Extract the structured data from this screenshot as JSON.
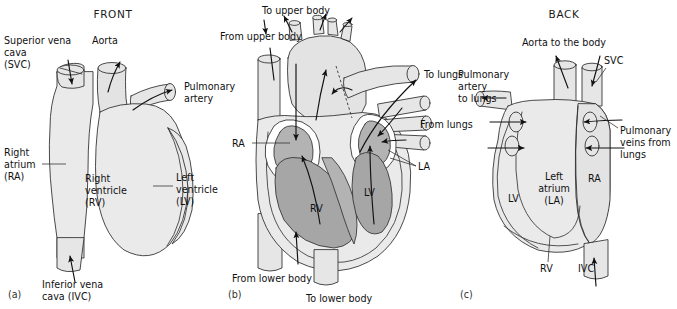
{
  "figure": {
    "colors": {
      "outline": "#2b2b2b",
      "muscle_fill": "#eaeaea",
      "vessel_fill": "#e6e6e6",
      "chamber_fill": "#b3b3b3",
      "valve_ring": "#ffffff",
      "text": "#1a1a1a",
      "background": "#ffffff"
    }
  },
  "panel_a": {
    "title": "FRONT",
    "caption": "(a)",
    "labels": {
      "svc": "Superior vena\ncava\n(SVC)",
      "svc_l1": "Superior vena",
      "svc_l2": "cava",
      "svc_l3": "(SVC)",
      "aorta": "Aorta",
      "pulmonary_artery_l1": "Pulmonary",
      "pulmonary_artery_l2": "artery",
      "right_atrium_l1": "Right",
      "right_atrium_l2": "atrium",
      "right_atrium_l3": "(RA)",
      "right_ventricle_l1": "Right",
      "right_ventricle_l2": "ventricle",
      "right_ventricle_l3": "(RV)",
      "left_ventricle_l1": "Left",
      "left_ventricle_l2": "ventricle",
      "left_ventricle_l3": "(LV)",
      "ivc_l1": "Inferior vena",
      "ivc_l2": "cava (IVC)"
    }
  },
  "panel_b": {
    "caption": "(b)",
    "labels": {
      "to_upper_body": "To upper body",
      "from_upper_body": "From upper body",
      "to_lungs": "To lungs",
      "from_lungs": "From lungs",
      "ra": "RA",
      "la": "LA",
      "rv": "RV",
      "lv": "LV",
      "from_lower_body": "From lower body",
      "to_lower_body": "To lower body"
    }
  },
  "panel_c": {
    "title": "BACK",
    "caption": "(c)",
    "labels": {
      "aorta_to_body": "Aorta to the body",
      "svc": "SVC",
      "pulmonary_artery_l1": "Pulmonary",
      "pulmonary_artery_l2": "artery",
      "pulmonary_artery_l3": "to lungs",
      "pulmonary_veins_l1": "Pulmonary",
      "pulmonary_veins_l2": "veins from",
      "pulmonary_veins_l3": "lungs",
      "left_atrium_l1": "Left",
      "left_atrium_l2": "atrium",
      "left_atrium_l3": "(LA)",
      "lv": "LV",
      "ra": "RA",
      "rv": "RV",
      "ivc": "IVC"
    }
  }
}
